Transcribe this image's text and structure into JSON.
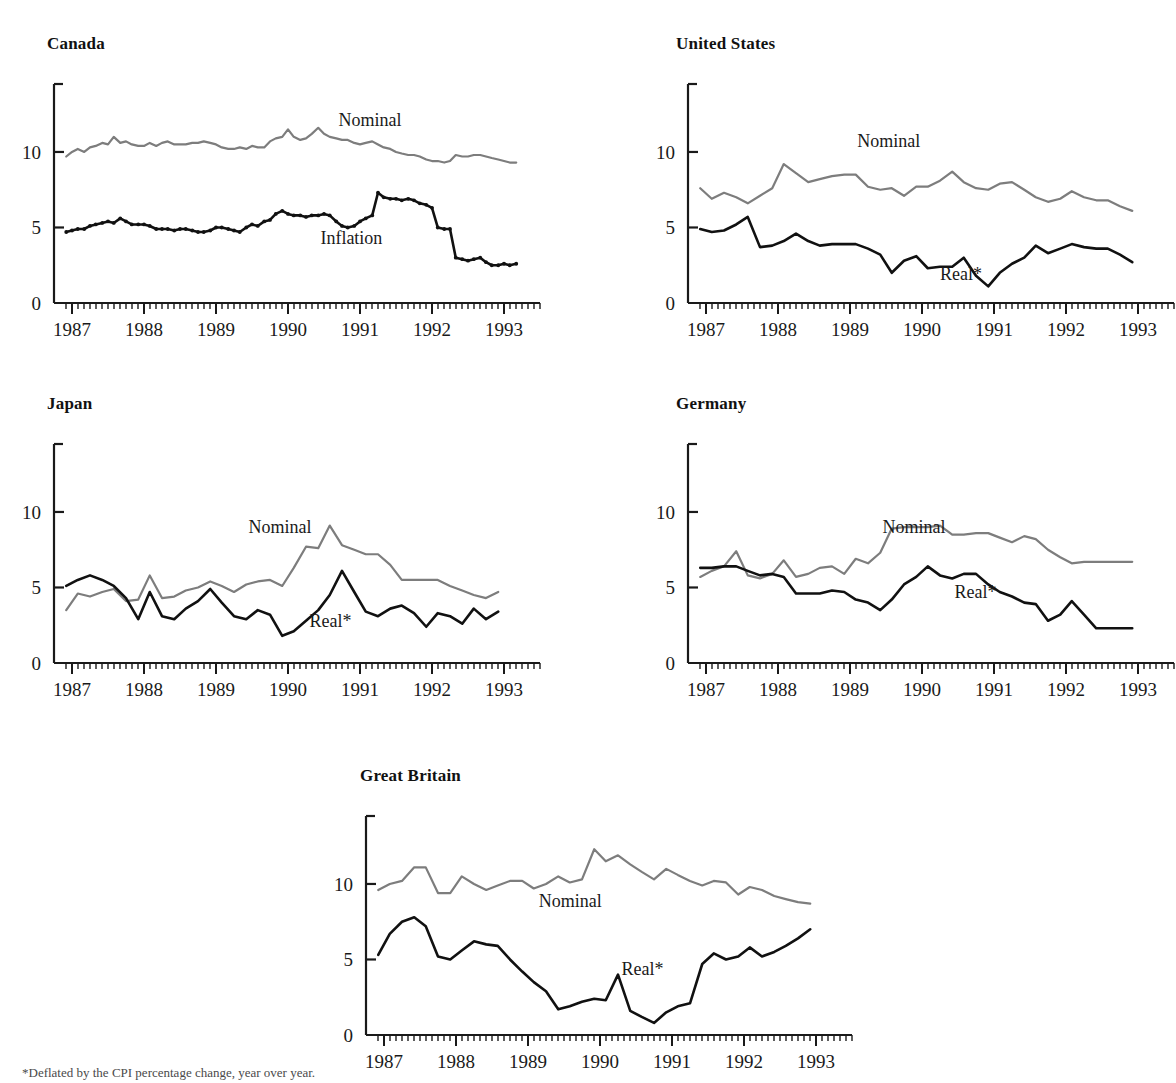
{
  "figure": {
    "footnote": "*Deflated by the CPI percentage change, year over year.",
    "colors": {
      "nominal": "#7d7d7d",
      "real": "#111111",
      "axis": "#1a1a1a"
    },
    "axis": {
      "y_ticks": [
        "0",
        "5",
        "10"
      ],
      "y_tick_values": [
        0,
        5,
        10
      ],
      "ylim": [
        0,
        14.5
      ],
      "x_ticks": [
        "1987",
        "1988",
        "1989",
        "1990",
        "1991",
        "1992",
        "1993"
      ],
      "x_tick_values": [
        1987,
        1988,
        1989,
        1990,
        1991,
        1992,
        1993
      ],
      "xlim": [
        1986.75,
        1993.5
      ],
      "minor_tick_interval_months": 1,
      "grid": false
    }
  },
  "chart_data": [
    {
      "type": "line",
      "title": "Canada",
      "xlabel": "",
      "ylabel": "",
      "xlim": [
        1986.75,
        1993.5
      ],
      "ylim": [
        0,
        14.5
      ],
      "x": [
        1986.92,
        1987.0,
        1987.08,
        1987.17,
        1987.25,
        1987.33,
        1987.42,
        1987.5,
        1987.58,
        1987.67,
        1987.75,
        1987.83,
        1987.92,
        1988.0,
        1988.08,
        1988.17,
        1988.25,
        1988.33,
        1988.42,
        1988.5,
        1988.58,
        1988.67,
        1988.75,
        1988.83,
        1988.92,
        1989.0,
        1989.08,
        1989.17,
        1989.25,
        1989.33,
        1989.42,
        1989.5,
        1989.58,
        1989.67,
        1989.75,
        1989.83,
        1989.92,
        1990.0,
        1990.08,
        1990.17,
        1990.25,
        1990.33,
        1990.42,
        1990.5,
        1990.58,
        1990.67,
        1990.75,
        1990.83,
        1990.92,
        1991.0,
        1991.08,
        1991.17,
        1991.25,
        1991.33,
        1991.42,
        1991.5,
        1991.58,
        1991.67,
        1991.75,
        1991.83,
        1991.92,
        1992.0,
        1992.08,
        1992.17,
        1992.25,
        1992.33,
        1992.42,
        1992.5,
        1992.58,
        1992.67,
        1992.75,
        1992.83,
        1992.92,
        1993.0,
        1993.08,
        1993.17
      ],
      "series": [
        {
          "name": "Nominal",
          "color": "#7d7d7d",
          "markers": false,
          "values": [
            9.7,
            10.0,
            10.2,
            10.0,
            10.3,
            10.4,
            10.6,
            10.5,
            11.0,
            10.6,
            10.7,
            10.5,
            10.4,
            10.4,
            10.6,
            10.4,
            10.6,
            10.7,
            10.5,
            10.5,
            10.5,
            10.6,
            10.6,
            10.7,
            10.6,
            10.5,
            10.3,
            10.2,
            10.2,
            10.3,
            10.2,
            10.4,
            10.3,
            10.3,
            10.7,
            10.9,
            11.0,
            11.5,
            11.0,
            10.8,
            10.9,
            11.2,
            11.6,
            11.2,
            11.0,
            10.9,
            10.8,
            10.8,
            10.6,
            10.5,
            10.6,
            10.7,
            10.5,
            10.3,
            10.2,
            10.0,
            9.9,
            9.8,
            9.8,
            9.7,
            9.5,
            9.4,
            9.4,
            9.3,
            9.4,
            9.8,
            9.7,
            9.7,
            9.8,
            9.8,
            9.7,
            9.6,
            9.5,
            9.4,
            9.3,
            9.3
          ]
        },
        {
          "name": "Inflation",
          "color": "#111111",
          "markers": true,
          "values": [
            4.7,
            4.8,
            4.9,
            4.9,
            5.1,
            5.2,
            5.3,
            5.4,
            5.3,
            5.6,
            5.4,
            5.2,
            5.2,
            5.2,
            5.1,
            4.9,
            4.9,
            4.9,
            4.8,
            4.9,
            4.9,
            4.8,
            4.7,
            4.7,
            4.8,
            5.0,
            5.0,
            4.9,
            4.8,
            4.7,
            5.0,
            5.2,
            5.1,
            5.4,
            5.5,
            5.9,
            6.1,
            5.9,
            5.8,
            5.8,
            5.7,
            5.8,
            5.8,
            5.9,
            5.8,
            5.4,
            5.1,
            5.0,
            5.1,
            5.4,
            5.6,
            5.8,
            7.3,
            7.0,
            6.9,
            6.9,
            6.8,
            6.9,
            6.8,
            6.6,
            6.5,
            6.3,
            5.0,
            4.9,
            4.9,
            3.0,
            2.9,
            2.8,
            2.9,
            3.0,
            2.7,
            2.5,
            2.5,
            2.6,
            2.5,
            2.6
          ]
        },
        {
          "name": "Inflation-tail",
          "color": "#111111",
          "markers": true,
          "values": [
            null,
            null,
            null,
            null,
            null,
            null,
            null,
            null,
            null,
            null,
            null,
            null,
            null,
            null,
            null,
            null,
            null,
            null,
            null,
            null,
            null,
            null,
            null,
            null,
            null,
            null,
            null,
            null,
            null,
            null,
            null,
            null,
            null,
            null,
            null,
            null,
            null,
            null,
            null,
            null,
            null,
            null,
            null,
            null,
            null,
            null,
            null,
            null,
            null,
            null,
            null,
            null,
            null,
            null,
            null,
            null,
            null,
            null,
            null,
            null,
            null,
            null,
            null,
            null,
            null,
            null,
            null,
            null,
            null,
            null,
            null,
            null,
            null,
            null,
            null,
            null
          ]
        }
      ],
      "annotations": [
        {
          "text": "Nominal",
          "x": 1990.7,
          "y": 11.7
        },
        {
          "text": "Inflation",
          "x": 1990.45,
          "y": 3.9
        }
      ]
    },
    {
      "type": "line",
      "title": "United States",
      "xlabel": "",
      "ylabel": "",
      "xlim": [
        1986.75,
        1993.5
      ],
      "ylim": [
        0,
        14.5
      ],
      "x": [
        1986.92,
        1987.08,
        1987.25,
        1987.42,
        1987.58,
        1987.75,
        1987.92,
        1988.08,
        1988.25,
        1988.42,
        1988.58,
        1988.75,
        1988.92,
        1989.08,
        1989.25,
        1989.42,
        1989.58,
        1989.75,
        1989.92,
        1990.08,
        1990.25,
        1990.42,
        1990.58,
        1990.75,
        1990.92,
        1991.08,
        1991.25,
        1991.42,
        1991.58,
        1991.75,
        1991.92,
        1992.08,
        1992.25,
        1992.42,
        1992.58,
        1992.75,
        1992.92
      ],
      "series": [
        {
          "name": "Nominal",
          "color": "#7d7d7d",
          "markers": false,
          "values": [
            7.6,
            6.9,
            7.3,
            7.0,
            6.6,
            7.1,
            7.6,
            9.2,
            8.6,
            8.0,
            8.2,
            8.4,
            8.5,
            8.5,
            7.7,
            7.5,
            7.6,
            7.1,
            7.7,
            7.7,
            8.1,
            8.7,
            8.0,
            7.6,
            7.5,
            7.9,
            8.0,
            7.5,
            7.0,
            6.7,
            6.9,
            7.4,
            7.0,
            6.8,
            6.8,
            6.4,
            6.1
          ]
        },
        {
          "name": "Real*",
          "color": "#111111",
          "markers": false,
          "values": [
            4.9,
            4.7,
            4.8,
            5.2,
            5.7,
            3.7,
            3.8,
            4.1,
            4.6,
            4.1,
            3.8,
            3.9,
            3.9,
            3.9,
            3.6,
            3.2,
            2.0,
            2.8,
            3.1,
            2.3,
            2.4,
            2.4,
            3.0,
            1.8,
            1.1,
            2.0,
            2.6,
            3.0,
            3.8,
            3.3,
            3.6,
            3.9,
            3.7,
            3.6,
            3.6,
            3.2,
            2.7
          ]
        }
      ],
      "annotations": [
        {
          "text": "Nominal",
          "x": 1989.1,
          "y": 10.3
        },
        {
          "text": "Real*",
          "x": 1990.25,
          "y": 1.5
        }
      ]
    },
    {
      "type": "line",
      "title": "Japan",
      "xlabel": "",
      "ylabel": "",
      "xlim": [
        1986.75,
        1993.5
      ],
      "ylim": [
        0,
        14.5
      ],
      "x": [
        1986.92,
        1987.08,
        1987.25,
        1987.42,
        1987.58,
        1987.75,
        1987.92,
        1988.08,
        1988.25,
        1988.42,
        1988.58,
        1988.75,
        1988.92,
        1989.08,
        1989.25,
        1989.42,
        1989.58,
        1989.75,
        1989.92,
        1990.08,
        1990.25,
        1990.42,
        1990.58,
        1990.75,
        1990.92,
        1991.08,
        1991.25,
        1991.42,
        1991.58,
        1991.75,
        1991.92,
        1992.08,
        1992.25,
        1992.42,
        1992.58,
        1992.75,
        1992.92
      ],
      "series": [
        {
          "name": "Nominal",
          "color": "#7d7d7d",
          "markers": false,
          "values": [
            3.5,
            4.6,
            4.4,
            4.7,
            4.9,
            4.1,
            4.2,
            5.8,
            4.3,
            4.4,
            4.8,
            5.0,
            5.4,
            5.1,
            4.7,
            5.2,
            5.4,
            5.5,
            5.1,
            6.3,
            7.7,
            7.6,
            9.1,
            7.8,
            7.5,
            7.2,
            7.2,
            6.5,
            5.5,
            5.5,
            5.5,
            5.5,
            5.1,
            4.8,
            4.5,
            4.3,
            4.7
          ]
        },
        {
          "name": "Real*",
          "color": "#111111",
          "markers": false,
          "values": [
            5.1,
            5.5,
            5.8,
            5.5,
            5.1,
            4.3,
            2.9,
            4.7,
            3.1,
            2.9,
            3.6,
            4.1,
            4.9,
            4.0,
            3.1,
            2.9,
            3.5,
            3.2,
            1.8,
            2.1,
            2.8,
            3.5,
            4.5,
            6.1,
            4.7,
            3.4,
            3.1,
            3.6,
            3.8,
            3.3,
            2.4,
            3.3,
            3.1,
            2.6,
            3.6,
            2.9,
            3.4
          ]
        }
      ],
      "annotations": [
        {
          "text": "Nominal",
          "x": 1989.45,
          "y": 8.6
        },
        {
          "text": "Real*",
          "x": 1990.3,
          "y": 2.4
        }
      ]
    },
    {
      "type": "line",
      "title": "Germany",
      "xlabel": "",
      "ylabel": "",
      "xlim": [
        1986.75,
        1993.5
      ],
      "ylim": [
        0,
        14.5
      ],
      "x": [
        1986.92,
        1987.08,
        1987.25,
        1987.42,
        1987.58,
        1987.75,
        1987.92,
        1988.08,
        1988.25,
        1988.42,
        1988.58,
        1988.75,
        1988.92,
        1989.08,
        1989.25,
        1989.42,
        1989.58,
        1989.75,
        1989.92,
        1990.08,
        1990.25,
        1990.42,
        1990.58,
        1990.75,
        1990.92,
        1991.08,
        1991.25,
        1991.42,
        1991.58,
        1991.75,
        1991.92,
        1992.08,
        1992.25,
        1992.42,
        1992.58,
        1992.75,
        1992.92
      ],
      "series": [
        {
          "name": "Nominal",
          "color": "#7d7d7d",
          "markers": false,
          "values": [
            5.7,
            6.1,
            6.4,
            7.4,
            5.8,
            5.6,
            5.9,
            6.8,
            5.7,
            5.9,
            6.3,
            6.4,
            5.9,
            6.9,
            6.6,
            7.3,
            8.9,
            9.0,
            9.0,
            9.0,
            9.1,
            8.5,
            8.5,
            8.6,
            8.6,
            8.3,
            8.0,
            8.4,
            8.2,
            7.5,
            7.0,
            6.6,
            6.7,
            6.7,
            6.7,
            6.7,
            6.7
          ]
        },
        {
          "name": "Real*",
          "color": "#111111",
          "markers": false,
          "values": [
            6.3,
            6.3,
            6.4,
            6.4,
            6.1,
            5.8,
            5.9,
            5.7,
            4.6,
            4.6,
            4.6,
            4.8,
            4.7,
            4.2,
            4.0,
            3.5,
            4.2,
            5.2,
            5.7,
            6.4,
            5.8,
            5.6,
            5.9,
            5.9,
            5.2,
            4.7,
            4.4,
            4.0,
            3.9,
            2.8,
            3.2,
            4.1,
            3.2,
            2.3,
            2.3,
            2.3,
            2.3
          ]
        }
      ],
      "annotations": [
        {
          "text": "Nominal",
          "x": 1989.45,
          "y": 8.6
        },
        {
          "text": "Real*",
          "x": 1990.45,
          "y": 4.3
        }
      ]
    },
    {
      "type": "line",
      "title": "Great Britain",
      "xlabel": "",
      "ylabel": "",
      "xlim": [
        1986.75,
        1993.5
      ],
      "ylim": [
        0,
        14.5
      ],
      "x": [
        1986.92,
        1987.08,
        1987.25,
        1987.42,
        1987.58,
        1987.75,
        1987.92,
        1988.08,
        1988.25,
        1988.42,
        1988.58,
        1988.75,
        1988.92,
        1989.08,
        1989.25,
        1989.42,
        1989.58,
        1989.75,
        1989.92,
        1990.08,
        1990.25,
        1990.42,
        1990.58,
        1990.75,
        1990.92,
        1991.08,
        1991.25,
        1991.42,
        1991.58,
        1991.75,
        1991.92,
        1992.08,
        1992.25,
        1992.42,
        1992.58,
        1992.75,
        1992.92
      ],
      "series": [
        {
          "name": "Nominal",
          "color": "#7d7d7d",
          "markers": false,
          "values": [
            9.6,
            10.0,
            10.2,
            11.1,
            11.1,
            9.4,
            9.4,
            10.5,
            10.0,
            9.6,
            9.9,
            10.2,
            10.2,
            9.7,
            10.0,
            10.5,
            10.1,
            10.3,
            12.3,
            11.5,
            11.9,
            11.3,
            10.8,
            10.3,
            11.0,
            10.6,
            10.2,
            9.9,
            10.2,
            10.1,
            9.3,
            9.8,
            9.6,
            9.2,
            9.0,
            8.8,
            8.7
          ]
        },
        {
          "name": "Real*",
          "color": "#111111",
          "markers": false,
          "values": [
            5.3,
            6.7,
            7.5,
            7.8,
            7.2,
            5.2,
            5.0,
            5.6,
            6.2,
            6.0,
            5.9,
            5.0,
            4.2,
            3.5,
            2.9,
            1.7,
            1.9,
            2.2,
            2.4,
            2.3,
            4.0,
            1.6,
            1.2,
            0.8,
            1.5,
            1.9,
            2.1,
            4.7,
            5.4,
            5.0,
            5.2,
            5.8,
            5.2,
            5.5,
            5.9,
            6.4,
            7.0
          ]
        }
      ],
      "annotations": [
        {
          "text": "Nominal",
          "x": 1989.15,
          "y": 8.5
        },
        {
          "text": "Real*",
          "x": 1990.3,
          "y": 4.0
        }
      ]
    }
  ]
}
